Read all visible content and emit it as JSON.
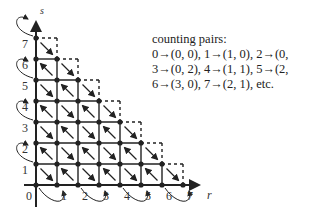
{
  "diagram": {
    "axes": {
      "x_label": "r",
      "y_label": "s",
      "x_ticks": [
        "0",
        "1",
        "2",
        "3",
        "4",
        "5",
        "6",
        "7"
      ],
      "y_ticks": [
        "1",
        "2",
        "3",
        "4",
        "5",
        "6",
        "7"
      ]
    },
    "note": {
      "heading": "counting pairs:",
      "lines": [
        "0→(0, 0), 1→(1, 0), 2→(0, 1),",
        "3→(0, 2), 4→(1, 1), 5→(2, 0),",
        "6→(3, 0), 7→(2, 1), etc."
      ]
    },
    "colors": {
      "ink": "#222222",
      "background": "#ffffff"
    }
  }
}
